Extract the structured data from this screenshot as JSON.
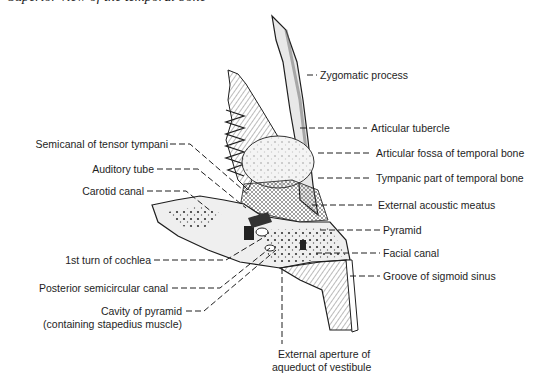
{
  "caption": "Superior view of the temporal bone",
  "labels_right": [
    {
      "id": "zygomatic-process",
      "text": "Zygomatic process",
      "x": 320,
      "y": 71
    },
    {
      "id": "articular-tubercle",
      "text": "Articular tubercle",
      "x": 371,
      "y": 124
    },
    {
      "id": "articular-fossa",
      "text": "Articular fossa of temporal bone",
      "x": 376,
      "y": 149
    },
    {
      "id": "tympanic-part",
      "text": "Tympanic part of temporal bone",
      "x": 376,
      "y": 173
    },
    {
      "id": "external-acoustic-meatus",
      "text": "External acoustic meatus",
      "x": 378,
      "y": 201
    },
    {
      "id": "pyramid",
      "text": "Pyramid",
      "x": 383,
      "y": 224
    },
    {
      "id": "facial-canal",
      "text": "Facial canal",
      "x": 383,
      "y": 247
    },
    {
      "id": "groove-sigmoid-sinus",
      "text": "Groove of sigmoid sinus",
      "x": 383,
      "y": 271
    }
  ],
  "labels_left": [
    {
      "id": "semicanal-tensor-tympani",
      "text": "Semicanal of tensor tympani",
      "right": 168,
      "y": 139
    },
    {
      "id": "auditory-tube",
      "text": "Auditory tube",
      "right": 154,
      "y": 164
    },
    {
      "id": "carotid-canal",
      "text": "Carotid canal",
      "right": 144,
      "y": 186
    },
    {
      "id": "first-turn-cochlea",
      "text": "1st turn of cochlea",
      "right": 151,
      "y": 256
    },
    {
      "id": "posterior-semicircular-canal",
      "text": "Posterior semicircular canal",
      "right": 168,
      "y": 284
    },
    {
      "id": "cavity-of-pyramid",
      "text": "Cavity of pyramid",
      "right": 182,
      "y": 307
    },
    {
      "id": "cavity-of-pyramid-note",
      "text": "(containing stapedius muscle)",
      "right": 182,
      "y": 320
    }
  ],
  "labels_bottom": [
    {
      "id": "external-aperture-line1",
      "text": "External aperture of",
      "x": 276,
      "y": 350
    },
    {
      "id": "external-aperture-line2",
      "text": "aqueduct of vestibule",
      "x": 272,
      "y": 363
    }
  ],
  "colors": {
    "ink": "#1e1e1e",
    "bone_fill": "#f2f2f2",
    "shade": "#9a9a9a",
    "dark": "#3a3a3a"
  }
}
